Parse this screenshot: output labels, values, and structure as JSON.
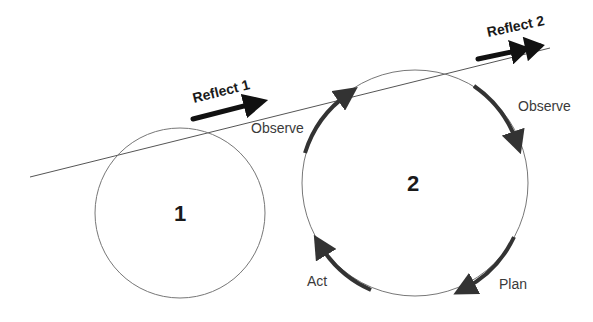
{
  "diagram": {
    "circles": [
      {
        "label": "1"
      },
      {
        "label": "2"
      }
    ],
    "reflect_labels": [
      "Reflect 1",
      "Reflect 2"
    ],
    "cycle_labels": {
      "observe_left": "Observe",
      "observe_right": "Observe",
      "plan": "Plan",
      "act": "Act"
    },
    "colors": {
      "line": "#555555",
      "arrow": "#333333",
      "reflect_arrow": "#111111"
    }
  }
}
